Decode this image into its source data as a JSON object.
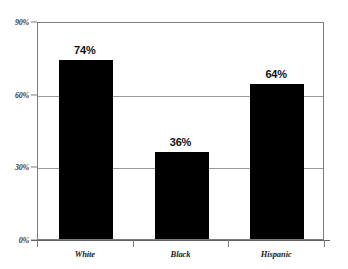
{
  "chart_data": {
    "type": "bar",
    "title": "",
    "subtitle": "",
    "xlabel": "",
    "ylabel": "",
    "categories": [
      "White",
      "Black",
      "Hispanic"
    ],
    "values": [
      74,
      36,
      64
    ],
    "value_labels": [
      "74%",
      "36%",
      "64%"
    ],
    "ylim": [
      0,
      90
    ],
    "yticks": [
      0,
      30,
      60,
      90
    ],
    "ytick_labels": [
      "0%",
      "30%",
      "60%",
      "90%"
    ],
    "grid": "horizontal",
    "legend": "none",
    "series": [
      {
        "name": "",
        "values": [
          74,
          36,
          64
        ]
      }
    ],
    "colors": {
      "bar": "#000000",
      "gridline": "#9a9a9a",
      "frame": "#7d7d7d",
      "axis": "#5f5f5f",
      "background": "#ffffff",
      "label_text": "#111111",
      "tick_text": "#3a3a3a"
    }
  }
}
